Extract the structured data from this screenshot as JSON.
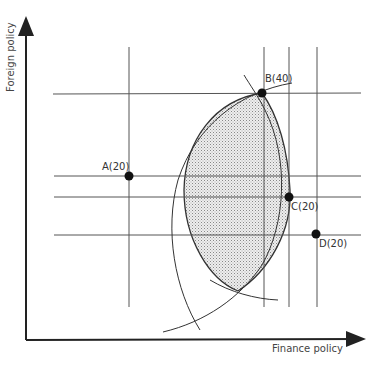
{
  "diagram": {
    "x_axis_label": "Finance policy",
    "y_axis_label": "Foreign policy",
    "points": [
      {
        "id": "A",
        "label": "A(20)",
        "x": 129,
        "y": 176
      },
      {
        "id": "B",
        "label": "B(40)",
        "x": 262,
        "y": 93
      },
      {
        "id": "C",
        "label": "C(20)",
        "x": 289,
        "y": 197
      },
      {
        "id": "D",
        "label": "D(20)",
        "x": 316,
        "y": 234
      }
    ],
    "colors": {
      "line": "#333333",
      "axis": "#222222",
      "shade": "#d8d8d8"
    }
  }
}
